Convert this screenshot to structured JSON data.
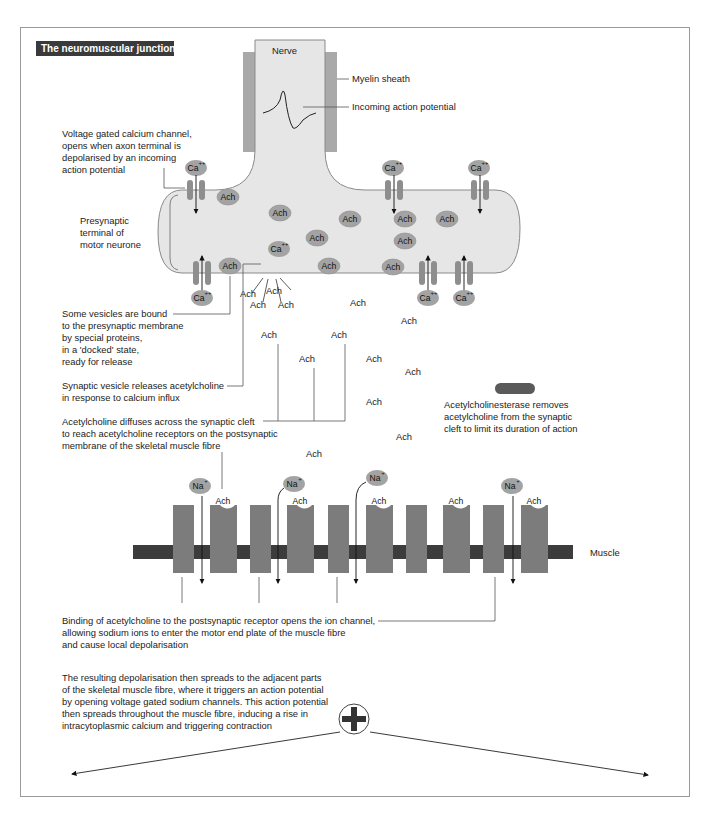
{
  "title": "The neuromuscular junction",
  "colors": {
    "cell_fill": "#e6e6e6",
    "cell_stroke": "#8a8a8a",
    "myelin": "#a9a9a9",
    "vesicle": "#a3a3a3",
    "channel": "#8e8e8e",
    "receptor": "#7c7c7c",
    "muscle_bar": "#3c3c3c",
    "enzyme": "#5a5a5a",
    "title_bg": "#3a3a3a"
  },
  "labels": {
    "nerve": "Nerve",
    "myelin": "Myelin sheath",
    "incoming_ap": "Incoming action potential",
    "ca_channel": [
      "Voltage gated calcium channel,",
      "opens when axon terminal is",
      "depolarised by an incoming",
      "action potential"
    ],
    "presynaptic": [
      "Presynaptic",
      "terminal of",
      "motor neurone"
    ],
    "docked": [
      "Some vesicles are bound",
      "to the presynaptic membrane",
      "by special proteins,",
      "in a 'docked' state,",
      "ready for release"
    ],
    "release": [
      "Synaptic vesicle releases acetylcholine",
      "in response to calcium influx"
    ],
    "diffuse": [
      "Acetylcholine diffuses across the synaptic cleft",
      "to reach acetylcholine receptors on the postsynaptic",
      "membrane of the skeletal muscle fibre"
    ],
    "ache": [
      "Acetylcholinesterase removes",
      "acetylcholine from the synaptic",
      "cleft to limit its duration of action"
    ],
    "muscle": "Muscle",
    "binding": [
      "Binding of acetylcholine to the postsynaptic receptor opens the ion channel,",
      "allowing sodium ions to enter the motor end plate of the muscle fibre",
      "and cause local depolarisation"
    ],
    "spread": [
      "The resulting depolarisation then spreads to the adjacent parts",
      "of the skeletal muscle fibre, where it triggers an action potential",
      "by opening voltage gated sodium channels. This action potential",
      "then spreads throughout the muscle fibre, inducing a rise in",
      "intracytoplasmic calcium and triggering contraction"
    ]
  },
  "ions": {
    "ca": "Ca",
    "ca_charge": "++",
    "na": "Na",
    "na_charge": "+",
    "ach": "Ach"
  },
  "vesicles": [
    {
      "x": 228,
      "y": 197
    },
    {
      "x": 280,
      "y": 213
    },
    {
      "x": 350,
      "y": 219
    },
    {
      "x": 317,
      "y": 238
    },
    {
      "x": 405,
      "y": 219
    },
    {
      "x": 447,
      "y": 219
    },
    {
      "x": 405,
      "y": 241
    },
    {
      "x": 230,
      "y": 266
    },
    {
      "x": 329,
      "y": 266
    },
    {
      "x": 393,
      "y": 267
    }
  ],
  "free_ach": [
    {
      "x": 248,
      "y": 297
    },
    {
      "x": 274,
      "y": 294
    },
    {
      "x": 258,
      "y": 308
    },
    {
      "x": 286,
      "y": 308
    },
    {
      "x": 358,
      "y": 306
    },
    {
      "x": 409,
      "y": 324
    },
    {
      "x": 269,
      "y": 338
    },
    {
      "x": 339,
      "y": 338
    },
    {
      "x": 307,
      "y": 362
    },
    {
      "x": 374,
      "y": 362
    },
    {
      "x": 413,
      "y": 375
    },
    {
      "x": 374,
      "y": 405
    },
    {
      "x": 404,
      "y": 440
    },
    {
      "x": 314,
      "y": 457
    }
  ],
  "presynaptic_ca_channels": [
    {
      "x": 196,
      "dir": "in",
      "ion_y": 172
    },
    {
      "x": 391,
      "dir": "in",
      "ion_y": 172
    },
    {
      "x": 477,
      "dir": "in",
      "ion_y": 172
    },
    {
      "x": 196,
      "dir": "out",
      "ion_y": 299
    },
    {
      "x": 428,
      "dir": "out",
      "ion_y": 299
    },
    {
      "x": 463,
      "dir": "out",
      "ion_y": 299
    }
  ],
  "na_ions": [
    {
      "x": 200,
      "y": 486
    },
    {
      "x": 294,
      "y": 486
    },
    {
      "x": 377,
      "y": 478
    },
    {
      "x": 513,
      "y": 486
    }
  ]
}
